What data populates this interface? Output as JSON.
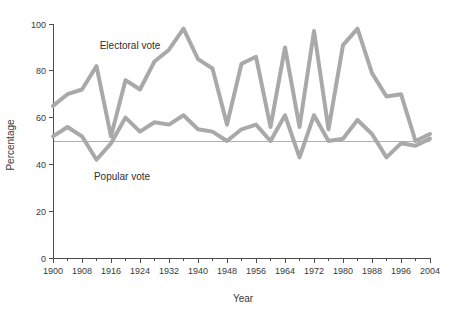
{
  "chart_data": {
    "type": "line",
    "title": "",
    "xlabel": "Year",
    "ylabel": "Percentage",
    "xlim": [
      1900,
      2004
    ],
    "ylim": [
      0,
      100
    ],
    "grid": false,
    "legend_position": "inline-annotations",
    "x_tick_step_minor": 4,
    "x_tick_step_major": 8,
    "y_ticks": [
      0,
      20,
      40,
      60,
      80,
      100
    ],
    "x_ticks": [
      1900,
      1908,
      1916,
      1924,
      1932,
      1940,
      1948,
      1956,
      1964,
      1972,
      1980,
      1988,
      1996,
      2004
    ],
    "x_ticks_labels": [
      "1900",
      "1908",
      "1916",
      "1924",
      "1932",
      "1940",
      "1948",
      "1956",
      "1964",
      "1972",
      "1980",
      "1988",
      "1996",
      "2004"
    ],
    "y_ticks_labels": [
      "0",
      "20",
      "40",
      "60",
      "80",
      "100"
    ],
    "reference_line": {
      "value": 50,
      "label": ""
    },
    "x": [
      1900,
      1904,
      1908,
      1912,
      1916,
      1920,
      1924,
      1928,
      1932,
      1936,
      1940,
      1944,
      1948,
      1952,
      1956,
      1960,
      1964,
      1968,
      1972,
      1976,
      1980,
      1984,
      1988,
      1992,
      1996,
      2000,
      2004
    ],
    "series": [
      {
        "name": "Electoral vote",
        "color": "#a9a9a9",
        "annotation": "Electoral vote",
        "values": [
          65,
          70,
          72,
          82,
          52,
          76,
          72,
          84,
          89,
          98,
          85,
          81,
          57,
          83,
          86,
          56,
          90,
          56,
          97,
          55,
          91,
          98,
          79,
          69,
          70,
          50,
          53
        ]
      },
      {
        "name": "Popular vote",
        "color": "#a9a9a9",
        "annotation": "Popular vote",
        "values": [
          52,
          56,
          52,
          42,
          49,
          60,
          54,
          58,
          57,
          61,
          55,
          54,
          50,
          55,
          57,
          50,
          61,
          43,
          61,
          50,
          51,
          59,
          53,
          43,
          49,
          48,
          51
        ]
      }
    ],
    "annotations": [
      {
        "text": "Electoral vote",
        "x_px": 130,
        "y_px": 49
      },
      {
        "text": "Popular vote",
        "x_px": 122,
        "y_px": 180
      }
    ]
  },
  "axis_titles": {
    "x": "Year",
    "y": "Percentage"
  },
  "colors": {
    "series_line": "#a9a9a9",
    "axis": "#4d4d4d",
    "reference": "#9a9a9a",
    "text": "#3a3a3a",
    "background": "#ffffff"
  }
}
